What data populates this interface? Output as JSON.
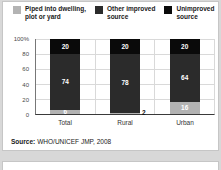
{
  "legend": {
    "items": [
      {
        "label": "Piped into dwelling,\nplot or yard",
        "color": "#b3b3b3"
      },
      {
        "label": "Other improved\nsource",
        "color": "#2b2b2b"
      },
      {
        "label": "Unimproved\nsource",
        "color": "#0a0a0a"
      }
    ]
  },
  "chart_data": {
    "type": "bar",
    "stacked": true,
    "categories": [
      "Total",
      "Rural",
      "Urban"
    ],
    "series": [
      {
        "name": "Piped into dwelling, plot or yard",
        "color": "#b3b3b3",
        "values": [
          6,
          2,
          16
        ]
      },
      {
        "name": "Other improved source",
        "color": "#2b2b2b",
        "values": [
          74,
          78,
          64
        ]
      },
      {
        "name": "Unimproved source",
        "color": "#0a0a0a",
        "values": [
          20,
          20,
          20
        ]
      }
    ],
    "y_ticks": [
      {
        "value": 0,
        "label": "0"
      },
      {
        "value": 20,
        "label": "20"
      },
      {
        "value": 40,
        "label": "40"
      },
      {
        "value": 60,
        "label": "60"
      },
      {
        "value": 80,
        "label": "80"
      },
      {
        "value": 100,
        "label": "100%"
      }
    ],
    "ylim": [
      0,
      100
    ],
    "grid": true,
    "legend_position": "top"
  },
  "source": {
    "label": "Source:",
    "text": "WHO/UNICEF JMP, 2008"
  }
}
